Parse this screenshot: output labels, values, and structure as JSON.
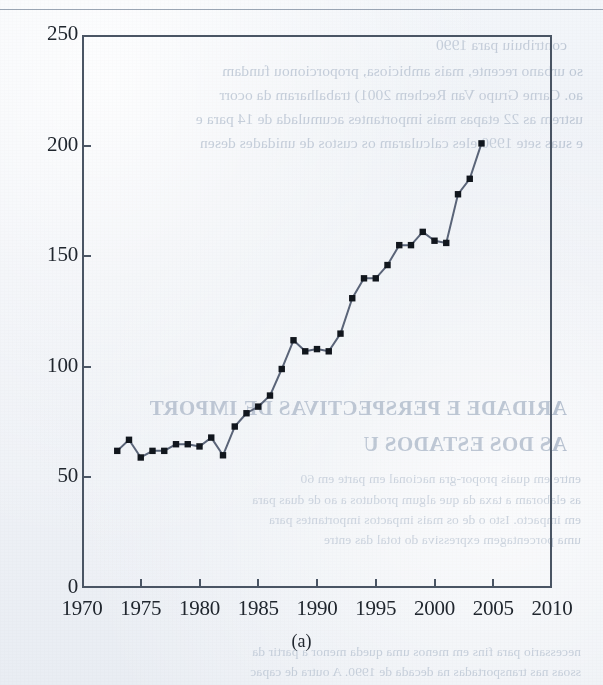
{
  "page": {
    "kind": "scanned-book-page",
    "background_color": "#eef1f6",
    "ink_color": "#20262e",
    "has_top_rule": true
  },
  "figure": {
    "caption": "(a)",
    "frame_color": "#4a5564",
    "line_color": "#5a6478",
    "marker_color": "#11161d"
  },
  "chart_data": {
    "type": "line",
    "title": "",
    "subtitle": "",
    "xlabel": "",
    "ylabel": "",
    "caption": "(a)",
    "xlim": [
      1970,
      2010
    ],
    "ylim": [
      0,
      250
    ],
    "xticks": [
      1970,
      1975,
      1980,
      1985,
      1990,
      1995,
      2000,
      2005,
      2010
    ],
    "xtick_labels": [
      "1970",
      "1975",
      "1980",
      "1985",
      "1990",
      "1995",
      "2000",
      "2005",
      "2010"
    ],
    "yticks": [
      0,
      50,
      100,
      150,
      200,
      250
    ],
    "ytick_labels": [
      "0",
      "50",
      "100",
      "150",
      "200",
      "250"
    ],
    "grid": false,
    "legend": null,
    "markers": "square",
    "x": [
      1973,
      1974,
      1975,
      1976,
      1977,
      1978,
      1979,
      1980,
      1981,
      1982,
      1983,
      1984,
      1985,
      1986,
      1987,
      1988,
      1989,
      1990,
      1991,
      1992,
      1993,
      1994,
      1995,
      1996,
      1997,
      1998,
      1999,
      2000,
      2001,
      2002,
      2003,
      2004
    ],
    "series": [
      {
        "name": "series-1",
        "values": [
          62,
          67,
          59,
          62,
          62,
          65,
          65,
          64,
          68,
          60,
          73,
          79,
          82,
          87,
          99,
          112,
          107,
          108,
          107,
          115,
          131,
          140,
          140,
          146,
          155,
          155,
          161,
          157,
          156,
          178,
          185,
          201
        ]
      }
    ]
  },
  "bleedthrough": {
    "note": "mirrored show-through text from the reverse side of the scanned page",
    "lines": [
      {
        "text": "contribuiu para 1990",
        "x": 36,
        "y": 36,
        "size": "normal"
      },
      {
        "text": "so urbano recente, mais ambiciosa, proporcionou fundam",
        "x": 20,
        "y": 62,
        "size": "normal"
      },
      {
        "text": "ao. Carne Grupo Van Rechem 2001) trabalharam da ocorr",
        "x": 20,
        "y": 86,
        "size": "normal"
      },
      {
        "text": "ustrem as 22 etapas mais importantes acumulada de 14 para e",
        "x": 20,
        "y": 110,
        "size": "normal"
      },
      {
        "text": "e suas sete 1990 eles calcularam os custos de unidades desen",
        "x": 20,
        "y": 134,
        "size": "normal"
      },
      {
        "text": "ARIDADE E PERSPECTIVAS DE IMPORT",
        "x": 36,
        "y": 396,
        "size": "big"
      },
      {
        "text": "AS DOS ESTADOS U",
        "x": 36,
        "y": 432,
        "size": "big"
      },
      {
        "text": "entre em quais propor-gra nacional em parte em 60",
        "x": 22,
        "y": 471,
        "size": "sm"
      },
      {
        "text": "as elaboram a taxa da que algum produtos a ao de duas para",
        "x": 22,
        "y": 492,
        "size": "sm"
      },
      {
        "text": "em impacto. Isto o de os mais impactos importantes para",
        "x": 22,
        "y": 512,
        "size": "sm"
      },
      {
        "text": "uma porcentagem expressiva do total das entre",
        "x": 22,
        "y": 532,
        "size": "sm"
      },
      {
        "text": "necessario para fins em menos uma queda menor a partir da",
        "x": 22,
        "y": 644,
        "size": "sm"
      },
      {
        "text": "ssoas nas transportadas na decada de 1990. A outra de capac",
        "x": 22,
        "y": 664,
        "size": "sm"
      }
    ]
  }
}
